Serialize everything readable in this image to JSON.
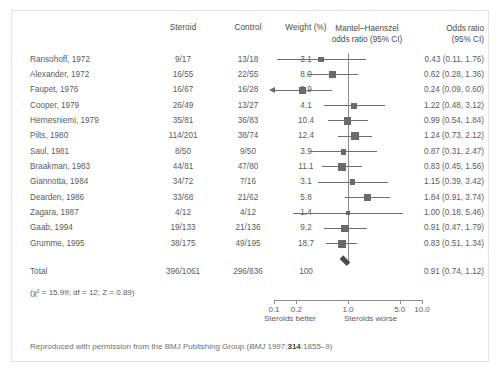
{
  "figure": {
    "headers": {
      "study": "",
      "steroid": "Steroid",
      "control": "Control",
      "weight": "Weight (%)",
      "plot_line1": "Mantel–Haenszel",
      "plot_line2": "odds ratio (95% CI)",
      "or_line1": "Odds ratio",
      "or_line2": "(95% CI)"
    },
    "total_row": {
      "label": "Total",
      "steroid": "396/1061",
      "control": "296/836",
      "weight": "100",
      "or_text": "0.91 (0.74, 1.12)"
    },
    "heterogeneity": "(χ² = 15.99; df = 12; Z = 0.89)",
    "axis_caption_better": "Steroids better",
    "axis_caption_worse": "Steroids worse",
    "footer_prefix": "Reproduced with permission from the BMJ Publishing Group (",
    "footer_journal": "BMJ",
    "footer_mid": " 1997;",
    "footer_volume": "314",
    "footer_suffix": ":1855–9)"
  },
  "chart_data": {
    "type": "forest",
    "title": "Mantel–Haenszel odds ratio (95% CI)",
    "xlabel": "Odds ratio (log scale)",
    "ylabel": "",
    "xscale": "log",
    "xlim": [
      0.1,
      10.0
    ],
    "ticks": [
      0.1,
      0.2,
      1.0,
      5.0,
      10.0
    ],
    "tick_labels": [
      "0.1",
      "0.2",
      "1.0",
      "5.0",
      "10.0"
    ],
    "reference_line": 1.0,
    "grid": false,
    "legend": "none",
    "marker_color": "#6a6a6a",
    "line_color": "#6e6e6e",
    "diamond_color": "#4d4d4d",
    "categories": [
      "Ransohoff, 1972",
      "Alexander, 1972",
      "Faupet, 1976",
      "Cooper, 1979",
      "Hernesniemi, 1979",
      "Pilts, 1980",
      "Saul, 1981",
      "Braakman, 1983",
      "Giannotta, 1984",
      "Dearden, 1986",
      "Zagara, 1987",
      "Gaab, 1994",
      "Grumme, 1995"
    ],
    "studies": [
      {
        "study": "Ransohoff, 1972",
        "steroid": "9/17",
        "control": "13/18",
        "weight": 3.1,
        "weight_text": "3.1",
        "or": 0.43,
        "lower": 0.11,
        "upper": 1.76,
        "or_text": "0.43 (0.11, 1.76)",
        "clipped_left": false
      },
      {
        "study": "Alexander, 1972",
        "steroid": "16/55",
        "control": "22/55",
        "weight": 8.0,
        "weight_text": "8.0",
        "or": 0.62,
        "lower": 0.28,
        "upper": 1.36,
        "or_text": "0.62 (0.28, 1.36)",
        "clipped_left": false
      },
      {
        "study": "Faupet, 1976",
        "steroid": "16/67",
        "control": "16/28",
        "weight": 8.9,
        "weight_text": "8.9",
        "or": 0.24,
        "lower": 0.09,
        "upper": 0.6,
        "or_text": "0.24 (0.09, 0.60)",
        "clipped_left": true
      },
      {
        "study": "Cooper, 1979",
        "steroid": "26/49",
        "control": "13/27",
        "weight": 4.1,
        "weight_text": "4.1",
        "or": 1.22,
        "lower": 0.48,
        "upper": 3.12,
        "or_text": "1.22 (0.48, 3.12)",
        "clipped_left": false
      },
      {
        "study": "Hernesniemi, 1979",
        "steroid": "35/81",
        "control": "36/83",
        "weight": 10.4,
        "weight_text": "10.4",
        "or": 0.99,
        "lower": 0.54,
        "upper": 1.84,
        "or_text": "0.99 (0.54, 1.84)",
        "clipped_left": false
      },
      {
        "study": "Pilts, 1980",
        "steroid": "114/201",
        "control": "38/74",
        "weight": 12.4,
        "weight_text": "12.4",
        "or": 1.24,
        "lower": 0.73,
        "upper": 2.12,
        "or_text": "1.24 (0.73, 2.12)",
        "clipped_left": false
      },
      {
        "study": "Saul, 1981",
        "steroid": "8/50",
        "control": "9/50",
        "weight": 3.9,
        "weight_text": "3.9",
        "or": 0.87,
        "lower": 0.31,
        "upper": 2.47,
        "or_text": "0.87 (0.31, 2.47)",
        "clipped_left": false
      },
      {
        "study": "Braakman, 1983",
        "steroid": "44/81",
        "control": "47/80",
        "weight": 11.1,
        "weight_text": "11.1",
        "or": 0.83,
        "lower": 0.45,
        "upper": 1.56,
        "or_text": "0.83 (0.45, 1.56)",
        "clipped_left": false
      },
      {
        "study": "Giannotta, 1984",
        "steroid": "34/72",
        "control": "7/16",
        "weight": 3.1,
        "weight_text": "3.1",
        "or": 1.15,
        "lower": 0.39,
        "upper": 3.42,
        "or_text": "1.15 (0.39, 3.42)",
        "clipped_left": false
      },
      {
        "study": "Dearden, 1986",
        "steroid": "33/68",
        "control": "21/62",
        "weight": 5.8,
        "weight_text": "5.8",
        "or": 1.84,
        "lower": 0.91,
        "upper": 3.74,
        "or_text": "1.84 (0.91, 3.74)",
        "clipped_left": false
      },
      {
        "study": "Zagara, 1987",
        "steroid": "4/12",
        "control": "4/12",
        "weight": 1.4,
        "weight_text": "1.4",
        "or": 1.0,
        "lower": 0.18,
        "upper": 5.46,
        "or_text": "1.00 (0.18, 5.46)",
        "clipped_left": false
      },
      {
        "study": "Gaab, 1994",
        "steroid": "19/133",
        "control": "21/136",
        "weight": 9.2,
        "weight_text": "9.2",
        "or": 0.91,
        "lower": 0.47,
        "upper": 1.79,
        "or_text": "0.91 (0.47, 1.79)",
        "clipped_left": false
      },
      {
        "study": "Grumme, 1995",
        "steroid": "38/175",
        "control": "49/195",
        "weight": 18.7,
        "weight_text": "18.7",
        "or": 0.83,
        "lower": 0.51,
        "upper": 1.34,
        "or_text": "0.83 (0.51, 1.34)",
        "clipped_left": false
      }
    ],
    "summary": {
      "label": "Total",
      "or": 0.91,
      "lower": 0.74,
      "upper": 1.12,
      "or_text": "0.91 (0.74, 1.12)",
      "weight_text": "100",
      "steroid": "396/1061",
      "control": "296/836"
    }
  }
}
